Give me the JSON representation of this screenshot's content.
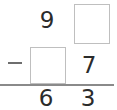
{
  "problem": {
    "type": "vertical-subtraction",
    "operator": "−",
    "minuend": {
      "tens": "9",
      "ones": ""
    },
    "subtrahend": {
      "tens": "",
      "ones": "7"
    },
    "difference": {
      "tens": "6",
      "ones": "3"
    },
    "blanks": [
      {
        "position": "minuend-ones",
        "value": ""
      },
      {
        "position": "subtrahend-tens",
        "value": ""
      }
    ]
  },
  "colors": {
    "background": "#ffffff",
    "digit": "#2b2b2b",
    "box_border": "#bfbfbf",
    "rule_line": "#8a8a8a",
    "minus": "#6e6e6e"
  }
}
